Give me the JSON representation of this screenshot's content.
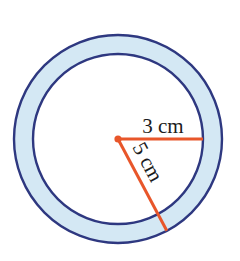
{
  "figure": {
    "background_color": "#ffffff",
    "ring": {
      "center": {
        "x": 118,
        "y": 139
      },
      "outer_radius": 104,
      "inner_radius": 85,
      "band_fill_color": "#d4e8f4",
      "interior_fill_color": "#ffffff",
      "stroke_color": "#2e3880",
      "stroke_width": 2.4
    },
    "center_dot": {
      "color": "#e8562a",
      "radius": 3.6
    },
    "radii": [
      {
        "id": "inner-radius",
        "label": "3 cm",
        "value": 3,
        "unit": "cm",
        "color": "#e8562a",
        "stroke_width": 3,
        "angle_degrees": 0,
        "length_px": 85,
        "label_position": {
          "x": 163,
          "y": 128
        },
        "label_rotation_degrees": 0,
        "label_font_size": 21
      },
      {
        "id": "outer-radius",
        "label": "5 cm",
        "value": 5,
        "unit": "cm",
        "color": "#e8562a",
        "stroke_width": 3,
        "angle_degrees": 62,
        "length_px": 104,
        "label_position": {
          "x": 146,
          "y": 163
        },
        "label_rotation_degrees": 62,
        "label_font_size": 21
      }
    ]
  }
}
